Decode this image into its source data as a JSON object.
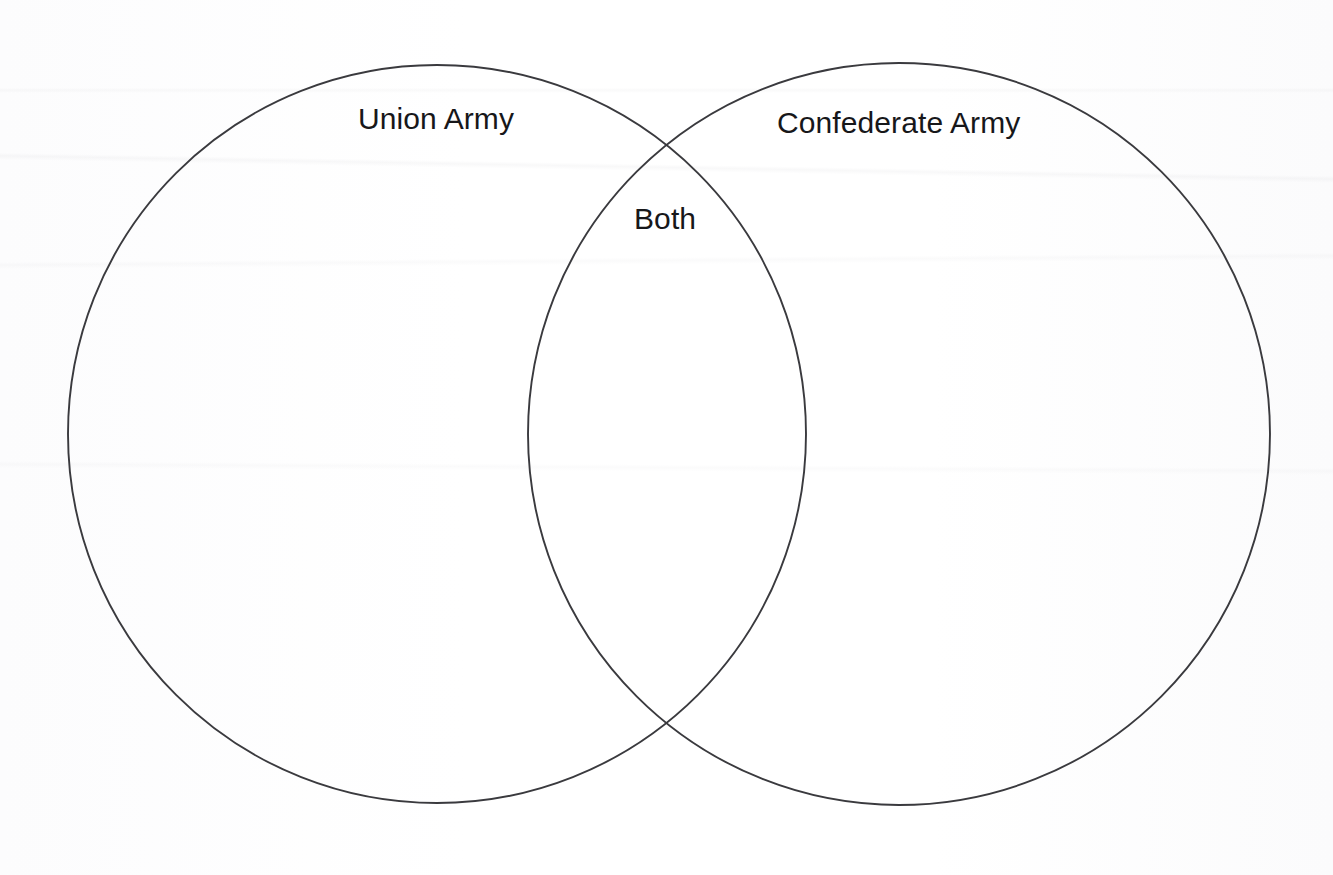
{
  "document": {
    "type": "venn-diagram",
    "title": "Venn diagram worksheet",
    "background_color": "#fdfdfd",
    "stroke_color": "#3a3a3e",
    "text_color": "#17171a"
  },
  "diagram": {
    "left_circle": {
      "label": "Union Army",
      "cx": 437,
      "cy": 434,
      "r": 369
    },
    "right_circle": {
      "label": "Confederate Army",
      "cx": 899,
      "cy": 434,
      "r": 371
    },
    "intersection": {
      "label": "Both"
    },
    "labels": [
      {
        "id": "union",
        "text": "Union Army"
      },
      {
        "id": "confederate",
        "text": "Confederate Army"
      },
      {
        "id": "both",
        "text": "Both"
      }
    ]
  },
  "chart_data": {
    "type": "venn",
    "title": "",
    "sets": [
      {
        "name": "Union Army",
        "items": []
      },
      {
        "name": "Confederate Army",
        "items": []
      }
    ],
    "intersection_label": "Both",
    "intersection_items": [],
    "legend": [],
    "annotations": []
  }
}
